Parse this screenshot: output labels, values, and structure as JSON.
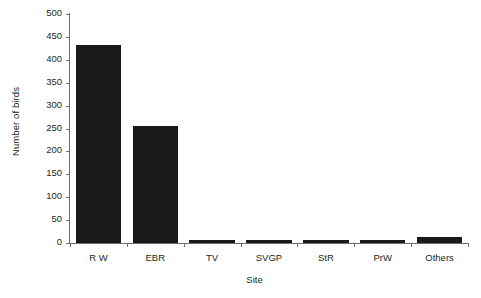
{
  "chart_data": {
    "type": "bar",
    "title": "",
    "xlabel": "Site",
    "ylabel": "Number of birds",
    "categories": [
      "R W",
      "EBR",
      "TV",
      "SVGP",
      "StR",
      "PrW",
      "Others"
    ],
    "values": [
      432,
      255,
      7,
      6,
      7,
      6,
      14
    ],
    "ylim": [
      0,
      500
    ],
    "ytick_values": [
      0,
      50,
      100,
      150,
      200,
      250,
      300,
      350,
      400,
      450,
      500
    ],
    "ytick_labels": [
      "0",
      "50",
      "100",
      "150",
      "200",
      "250",
      "300",
      "350",
      "400",
      "450",
      "500"
    ],
    "grid": false,
    "legend": false,
    "bar_color": "#1a1a1a",
    "axis_color": "#6d6e71",
    "background": "#ffffff"
  }
}
